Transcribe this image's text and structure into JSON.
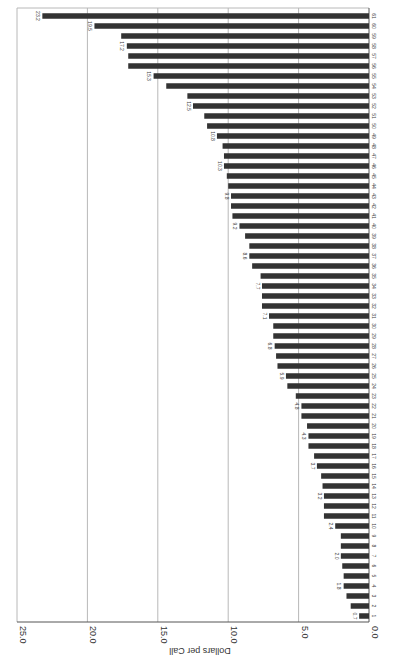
{
  "chart_data": {
    "type": "bar",
    "orientation": "horizontal (page rotated 90°)",
    "title": "",
    "xlabel": "",
    "ylabel": "Dollars per Call",
    "ylim": [
      0,
      25
    ],
    "yticks": [
      "0.0",
      "5.0",
      "10.0",
      "15.0",
      "20.0",
      "25.0"
    ],
    "grid": true,
    "legend": null,
    "categories": [
      "1",
      "2",
      "3",
      "4",
      "5",
      "6",
      "7",
      "8",
      "9",
      "10",
      "11",
      "12",
      "13",
      "14",
      "15",
      "16",
      "17",
      "18",
      "19",
      "20",
      "21",
      "22",
      "23",
      "24",
      "25",
      "26",
      "27",
      "28",
      "29",
      "30",
      "31",
      "32",
      "33",
      "34",
      "35",
      "36",
      "37",
      "38",
      "39",
      "40",
      "41",
      "42",
      "43",
      "44",
      "45",
      "46",
      "47",
      "48",
      "49",
      "50",
      "51",
      "52",
      "53",
      "54",
      "55",
      "56",
      "57",
      "58",
      "59",
      "60",
      "61"
    ],
    "values": [
      0.7,
      1.3,
      1.6,
      1.8,
      1.8,
      1.9,
      2.0,
      2.0,
      2.0,
      2.4,
      3.2,
      3.2,
      3.2,
      3.3,
      3.4,
      3.7,
      3.9,
      4.3,
      4.3,
      4.4,
      4.8,
      4.8,
      5.2,
      5.8,
      5.9,
      6.5,
      6.6,
      6.7,
      6.8,
      6.8,
      7.1,
      7.6,
      7.6,
      7.6,
      7.7,
      8.3,
      8.5,
      8.5,
      8.8,
      9.2,
      9.7,
      9.8,
      9.8,
      10.0,
      10.1,
      10.3,
      10.3,
      10.4,
      10.8,
      11.5,
      11.7,
      12.5,
      12.9,
      14.4,
      15.3,
      17.1,
      17.1,
      17.2,
      17.6,
      19.5,
      23.2
    ],
    "value_labels": [
      {
        "category": "1",
        "label": "0.7"
      },
      {
        "category": "4",
        "label": "1.8"
      },
      {
        "category": "7",
        "label": "2.0"
      },
      {
        "category": "10",
        "label": "2.4"
      },
      {
        "category": "13",
        "label": "3.2"
      },
      {
        "category": "16",
        "label": "3.7"
      },
      {
        "category": "19",
        "label": "4.3"
      },
      {
        "category": "22",
        "label": "4.8"
      },
      {
        "category": "25",
        "label": "5.9"
      },
      {
        "category": "28",
        "label": "6.8"
      },
      {
        "category": "31",
        "label": "7.1"
      },
      {
        "category": "34",
        "label": "7.7"
      },
      {
        "category": "37",
        "label": "8.6"
      },
      {
        "category": "40",
        "label": "9.2"
      },
      {
        "category": "43",
        "label": "9.8"
      },
      {
        "category": "46",
        "label": "10.3"
      },
      {
        "category": "49",
        "label": "10.8"
      },
      {
        "category": "52",
        "label": "12.5"
      },
      {
        "category": "55",
        "label": "15.3"
      },
      {
        "category": "58",
        "label": "17.2"
      },
      {
        "category": "60",
        "label": "19.5"
      },
      {
        "category": "61",
        "label": "23.2"
      }
    ]
  }
}
